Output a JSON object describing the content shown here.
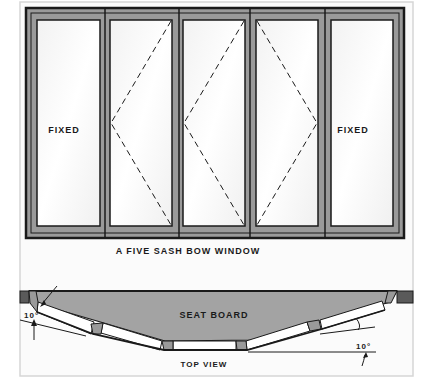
{
  "figure": {
    "title": "A FIVE SASH BOW WINDOW",
    "panels": [
      {
        "label": "FIXED",
        "type": "fixed"
      },
      {
        "label": "",
        "type": "casement-hinged-right"
      },
      {
        "label": "",
        "type": "casement-hinged-right"
      },
      {
        "label": "",
        "type": "casement-hinged-left"
      },
      {
        "label": "FIXED",
        "type": "fixed"
      }
    ],
    "top_view": {
      "caption": "TOP VIEW",
      "seat_label": "SEAT BOARD",
      "angle_left": "10°",
      "angle_right": "10°"
    }
  },
  "colors": {
    "frame_gray": "#9a9a9a",
    "seat_gray": "#a3a3a3",
    "line": "#1a1a1a",
    "glass": "#fafafa",
    "page_border": "#d6d6d6"
  }
}
